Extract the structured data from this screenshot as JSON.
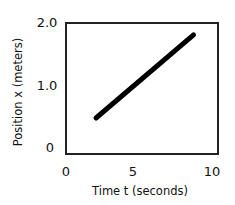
{
  "chart_data": {
    "type": "line",
    "title": "",
    "xlabel": "Time t (seconds)",
    "ylabel": "Position x (meters)",
    "xlim": [
      0,
      10
    ],
    "ylim": [
      0,
      2.0
    ],
    "xticks": [
      0,
      5,
      10
    ],
    "xtick_labels": [
      "0",
      "5",
      "10"
    ],
    "yticks": [
      0,
      1.0,
      2.0
    ],
    "ytick_labels": [
      "0",
      "1.0",
      "2.0"
    ],
    "grid": false,
    "legend": null,
    "series": [
      {
        "name": "position",
        "x": [
          2.0,
          8.5
        ],
        "y": [
          0.5,
          1.8
        ],
        "color": "#000000"
      }
    ]
  }
}
